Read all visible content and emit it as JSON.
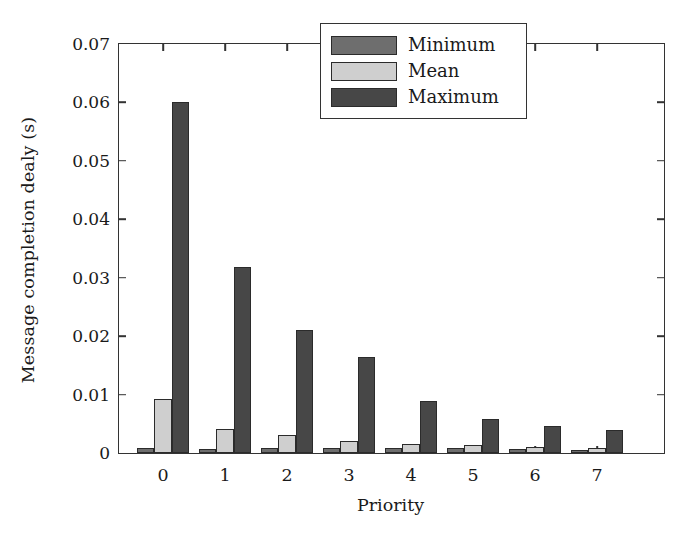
{
  "chart_data": {
    "type": "bar",
    "title": "",
    "xlabel": "Priority",
    "ylabel": "Message completion dealy (s)",
    "categories": [
      "0",
      "1",
      "2",
      "3",
      "4",
      "5",
      "6",
      "7"
    ],
    "xtick_labels": [
      "0",
      "1",
      "2",
      "3",
      "4",
      "5",
      "6",
      "7"
    ],
    "ytick_labels": [
      "0",
      "0.01",
      "0.02",
      "0.03",
      "0.04",
      "0.05",
      "0.06",
      "0.07"
    ],
    "ytick_values": [
      0,
      0.01,
      0.02,
      0.03,
      0.04,
      0.05,
      0.06,
      0.07
    ],
    "ylim": [
      0,
      0.07
    ],
    "grid": false,
    "legend_position": "upper right",
    "series": [
      {
        "name": "Minimum",
        "color": "#6e6e6e",
        "values": [
          0.0009,
          0.0007,
          0.0009,
          0.0008,
          0.0008,
          0.0008,
          0.0007,
          0.0005
        ]
      },
      {
        "name": "Mean",
        "color": "#cfcfcf",
        "values": [
          0.0092,
          0.0041,
          0.003,
          0.0021,
          0.0016,
          0.0014,
          0.0011,
          0.0009
        ]
      },
      {
        "name": "Maximum",
        "color": "#474747",
        "values": [
          0.06,
          0.0318,
          0.021,
          0.0164,
          0.0089,
          0.0059,
          0.0046,
          0.0039
        ]
      }
    ]
  },
  "legend": {
    "entries": [
      {
        "label": "Minimum",
        "color": "#6e6e6e"
      },
      {
        "label": "Mean",
        "color": "#cfcfcf"
      },
      {
        "label": "Maximum",
        "color": "#474747"
      }
    ]
  },
  "colors": {
    "axis": "#333333",
    "bar_edge": "#2b2b2b",
    "background": "#ffffff",
    "text": "#1a1a1a"
  }
}
